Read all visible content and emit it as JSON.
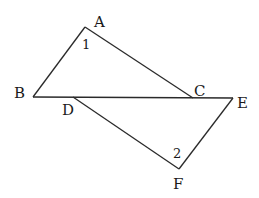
{
  "diagram": {
    "points": {
      "A": {
        "label": "A",
        "x": 85,
        "y": 27
      },
      "B": {
        "label": "B",
        "x": 33,
        "y": 97
      },
      "C": {
        "label": "C",
        "x": 193,
        "y": 98
      },
      "D": {
        "label": "D",
        "x": 73,
        "y": 97
      },
      "E": {
        "label": "E",
        "x": 233,
        "y": 98
      },
      "F": {
        "label": "F",
        "x": 179,
        "y": 169
      }
    },
    "segments": [
      [
        "A",
        "B"
      ],
      [
        "A",
        "C"
      ],
      [
        "B",
        "E"
      ],
      [
        "D",
        "F"
      ],
      [
        "E",
        "F"
      ]
    ],
    "angles": {
      "angle1": {
        "label": "1",
        "vertex": "A"
      },
      "angle2": {
        "label": "2",
        "vertex": "F"
      }
    }
  }
}
